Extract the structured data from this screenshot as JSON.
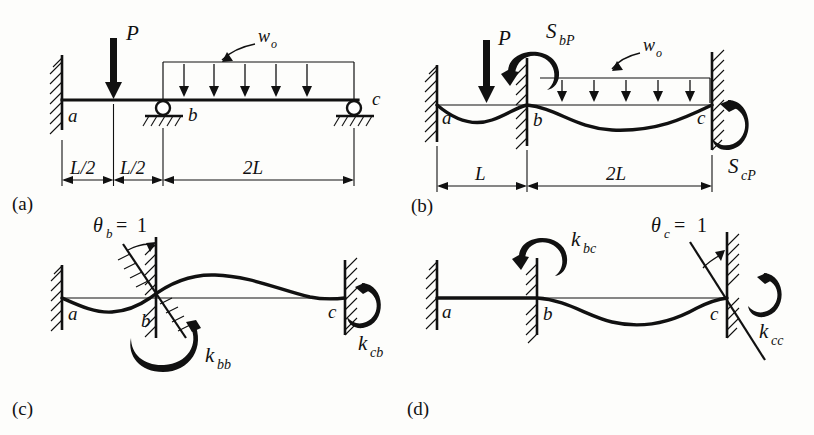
{
  "figure": {
    "panel_tags": {
      "a": "(a)",
      "b": "(b)",
      "c": "(c)",
      "d": "(d)"
    }
  },
  "panels": {
    "a": {
      "tag": "(a)",
      "caption": "Actual loaded beam: fixed at a, rollers at b and c",
      "nodes": {
        "a": "a",
        "b": "b",
        "c": "c"
      },
      "loads": {
        "point_load": "P",
        "distributed_load": "w",
        "distributed_sub": "o"
      },
      "dimensions": [
        {
          "label_main": "L/2",
          "label_sub": ""
        },
        {
          "label_main": "L/2",
          "label_sub": ""
        },
        {
          "label_main": "2L",
          "label_sub": ""
        }
      ],
      "supports": {
        "a": "fixed-wall",
        "b": "roller",
        "c": "roller"
      },
      "load_arrow_count": 5
    },
    "b": {
      "tag": "(b)",
      "caption": "Primary (restrained) system with fixed-end moments",
      "nodes": {
        "a": "a",
        "b": "b",
        "c": "c"
      },
      "loads": {
        "point_load": "P",
        "distributed_load": "w",
        "distributed_sub": "o"
      },
      "moments": [
        {
          "main": "S",
          "sub": "bP",
          "location": "b",
          "sense": "counterclockwise"
        },
        {
          "main": "S",
          "sub": "cP",
          "location": "c",
          "sense": "counterclockwise"
        }
      ],
      "dimensions": [
        {
          "label_main": "L"
        },
        {
          "label_main": "2L"
        }
      ],
      "supports": {
        "a": "fixed-wall",
        "b": "fixed-wall",
        "c": "fixed-wall"
      },
      "load_arrow_count": 5
    },
    "c": {
      "tag": "(c)",
      "caption": "Unit rotation applied at b",
      "nodes": {
        "a": "a",
        "b": "b",
        "c": "c"
      },
      "unit_rotation": {
        "symbol": "θ",
        "sub": "b",
        "equals": "=",
        "value": "1",
        "location": "b"
      },
      "moments": [
        {
          "main": "k",
          "sub": "bb",
          "location": "b",
          "sense": "clockwise"
        },
        {
          "main": "k",
          "sub": "cb",
          "location": "c",
          "sense": "counterclockwise"
        }
      ],
      "supports": {
        "a": "fixed-wall",
        "b": "rotated-fixed",
        "c": "fixed-wall"
      }
    },
    "d": {
      "tag": "(d)",
      "caption": "Unit rotation applied at c",
      "nodes": {
        "a": "a",
        "b": "b",
        "c": "c"
      },
      "unit_rotation": {
        "symbol": "θ",
        "sub": "c",
        "equals": "=",
        "value": "1",
        "location": "c"
      },
      "moments": [
        {
          "main": "k",
          "sub": "bc",
          "location": "b",
          "sense": "counterclockwise"
        },
        {
          "main": "k",
          "sub": "cc",
          "location": "c",
          "sense": "counterclockwise"
        }
      ],
      "supports": {
        "a": "fixed-wall",
        "b": "fixed-wall",
        "c": "rotated-fixed"
      }
    }
  },
  "colors": {
    "ink": "#111111",
    "paper": "#fdfdfb"
  }
}
